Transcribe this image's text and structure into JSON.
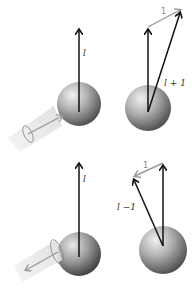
{
  "diagram": {
    "panels": [
      {
        "id": "top-left",
        "description": "Atom with angular momentum l absorbing incoming photon",
        "l_label": "l",
        "photon_direction": "incoming"
      },
      {
        "id": "top-right",
        "description": "Vector addition: l + 1 = l+1",
        "l_label": "",
        "photon_label": "1",
        "result_label": "l + 1"
      },
      {
        "id": "bottom-left",
        "description": "Atom with angular momentum l emitting outgoing photon",
        "l_label": "l",
        "photon_direction": "outgoing"
      },
      {
        "id": "bottom-right",
        "description": "Vector subtraction: l - 1 = l-1",
        "l_label": "",
        "photon_label": "1",
        "result_label": "l −1"
      }
    ],
    "colors": {
      "l_vector": "#111111",
      "photon_vector": "#999999",
      "sphere_light": "#e6e6e6",
      "sphere_dark": "#555555",
      "photon_beam": "#eeeeee"
    }
  }
}
